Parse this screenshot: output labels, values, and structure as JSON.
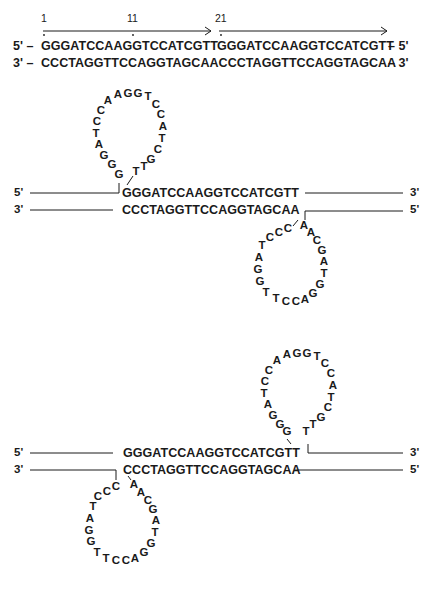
{
  "top_duplex": {
    "position_labels": [
      "1",
      "11",
      "21"
    ],
    "strand_top": {
      "left_end": "5' –",
      "seq_a": "GGGATCCAAGGTCCATCGTT",
      "seq_b": "GGGATCCAAGGTCCATCGTT",
      "right_end": "– 5'"
    },
    "strand_bottom": {
      "left_end": "3' –",
      "seq": "CCCTAGGTTCCAGGTAGCAACCCTAGGTTCCAGGTAGCAA",
      "right_end": "– 3'"
    }
  },
  "cruciform_1": {
    "top_left_end": "5'",
    "top_right_end": "3'",
    "bottom_left_end": "3'",
    "bottom_right_end": "5'",
    "top_seq": "GGGATCCAAGGTCCATCGTT",
    "bottom_seq": "CCCTAGGTTCCAGGTAGCAA",
    "upper_loop": [
      "G",
      "G",
      "G",
      "A",
      "T",
      "C",
      "C",
      "A",
      "A",
      "G",
      "G",
      "T",
      "C",
      "C",
      "A",
      "T",
      "C",
      "G",
      "T",
      "T"
    ],
    "lower_loop": [
      "C",
      "C",
      "C",
      "T",
      "A",
      "G",
      "G",
      "T",
      "T",
      "C",
      "C",
      "A",
      "G",
      "G",
      "T",
      "A",
      "G",
      "C",
      "A",
      "A"
    ]
  },
  "cruciform_2": {
    "top_left_end": "5'",
    "top_right_end": "3'",
    "bottom_left_end": "3'",
    "bottom_right_end": "5'",
    "top_seq": "GGGATCCAAGGTCCATCGTT",
    "bottom_seq": "CCCTAGGTTCCAGGTAGCAA",
    "upper_loop": [
      "G",
      "G",
      "G",
      "A",
      "T",
      "C",
      "C",
      "A",
      "A",
      "G",
      "G",
      "T",
      "C",
      "C",
      "A",
      "T",
      "C",
      "G",
      "T",
      "T"
    ],
    "lower_loop": [
      "C",
      "C",
      "C",
      "T",
      "A",
      "G",
      "G",
      "T",
      "T",
      "C",
      "C",
      "A",
      "G",
      "G",
      "T",
      "A",
      "G",
      "C",
      "A",
      "A"
    ]
  }
}
